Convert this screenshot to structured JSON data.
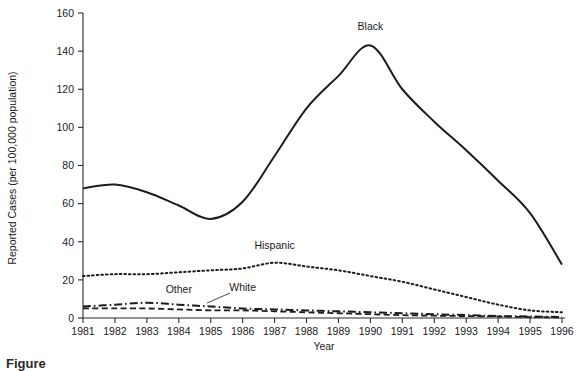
{
  "chart_data": {
    "type": "line",
    "title": "",
    "xlabel": "Year",
    "ylabel": "Reported Cases (per 100,000 population)",
    "x": [
      1981,
      1982,
      1983,
      1984,
      1985,
      1986,
      1987,
      1988,
      1989,
      1990,
      1991,
      1992,
      1993,
      1994,
      1995,
      1996
    ],
    "xtick_labels": [
      "1981",
      "1982",
      "1983",
      "1984",
      "1985",
      "1986",
      "1987",
      "1988",
      "1989",
      "1990",
      "1991",
      "1992",
      "1993",
      "1994",
      "1995",
      "1996"
    ],
    "ytick_labels": [
      "0",
      "20",
      "40",
      "60",
      "80",
      "100",
      "120",
      "140",
      "160"
    ],
    "yticks": [
      0,
      20,
      40,
      60,
      80,
      100,
      120,
      140,
      160
    ],
    "ylim": [
      0,
      160
    ],
    "xlim": [
      1981,
      1996
    ],
    "grid": false,
    "legend_position": "inline-annotations",
    "series": [
      {
        "name": "Black",
        "label": "Black",
        "style": "solid",
        "color": "#1c1c1c",
        "values": [
          68,
          70,
          66,
          59,
          52,
          61,
          85,
          110,
          127,
          143,
          120,
          103,
          88,
          72,
          55,
          28
        ]
      },
      {
        "name": "Hispanic",
        "label": "Hispanic",
        "style": "dotted",
        "color": "#1c1c1c",
        "values": [
          22,
          23,
          23,
          24,
          25,
          26,
          29,
          27,
          25,
          22,
          19,
          15,
          11,
          7,
          4,
          3
        ]
      },
      {
        "name": "Other",
        "label": "Other",
        "style": "dash-dot",
        "color": "#1c1c1c",
        "values": [
          6,
          7,
          8,
          7,
          6,
          5,
          4.5,
          4,
          3.5,
          3,
          2.5,
          2,
          1.5,
          1,
          0.8,
          0.5
        ]
      },
      {
        "name": "White",
        "label": "White",
        "style": "dashed",
        "color": "#1c1c1c",
        "values": [
          5,
          5,
          5,
          4.5,
          4,
          4,
          3.5,
          3,
          2.5,
          2,
          1.5,
          1.2,
          1,
          0.8,
          0.5,
          0.3
        ]
      }
    ],
    "annotations": [
      {
        "text": "Black",
        "x": 1990,
        "y": 151,
        "anchor": "middle"
      },
      {
        "text": "Hispanic",
        "x": 1987,
        "y": 36,
        "anchor": "middle"
      },
      {
        "text": "Other",
        "x": 1984,
        "y": 13,
        "anchor": "middle"
      },
      {
        "text": "White",
        "x": 1986,
        "y": 14,
        "anchor": "middle"
      }
    ]
  },
  "caption": {
    "text": "Figure"
  }
}
